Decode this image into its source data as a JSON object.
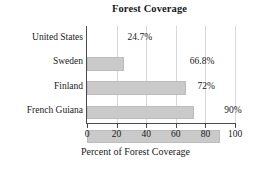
{
  "chart_data": {
    "type": "bar",
    "orientation": "horizontal",
    "title": "Forest Coverage",
    "xlabel": "Percent of Forest Coverage",
    "ylabel": "",
    "categories": [
      "United States",
      "Sweden",
      "Finland",
      "French Guiana"
    ],
    "values": [
      24.7,
      66.8,
      72,
      90
    ],
    "value_labels": [
      "24.7%",
      "66.8%",
      "72%",
      "90%"
    ],
    "xlim": [
      0,
      100
    ],
    "xticks": [
      0,
      20,
      40,
      60,
      80,
      100
    ],
    "xtick_labels": [
      "0",
      "20",
      "40",
      "60",
      "80",
      "100"
    ],
    "grid": true,
    "grid_axis": "x",
    "legend": null,
    "bar_color": "#cacaca",
    "bar_edge_color": "#bcbcbc",
    "axis_color": "#4a4a4a",
    "grid_color": "#d8d8d8",
    "background": "#ffffff"
  }
}
